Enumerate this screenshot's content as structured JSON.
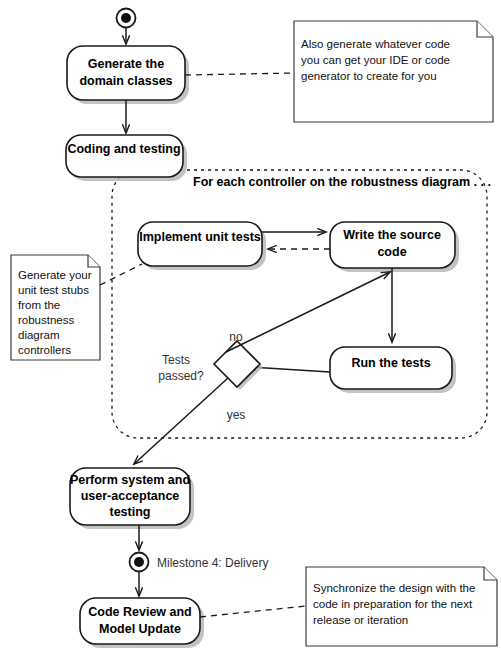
{
  "diagram": {
    "colors": {
      "stroke": "#1a1a1a",
      "fill": "#ffffff",
      "shadow": "#b9b9b9",
      "note_stroke": "#3a3a3a",
      "label_text": "#333333"
    },
    "start_node": {
      "name": "initial-node"
    },
    "activities": [
      {
        "id": "generate-domain-classes",
        "lines": [
          "Generate the",
          "domain classes"
        ]
      },
      {
        "id": "coding-and-testing",
        "lines": [
          "Coding and testing"
        ]
      },
      {
        "id": "implement-unit-tests",
        "lines": [
          "Implement unit tests"
        ]
      },
      {
        "id": "write-the-source-code",
        "lines": [
          "Write the source",
          "code"
        ]
      },
      {
        "id": "run-the-tests",
        "lines": [
          "Run the tests"
        ]
      },
      {
        "id": "perform-system-testing",
        "lines": [
          "Perform system and",
          "user-acceptance",
          "testing"
        ]
      },
      {
        "id": "code-review-model-update",
        "lines": [
          "Code Review and",
          "Model Update"
        ]
      }
    ],
    "region": {
      "label": "For each controller on the robustness diagram . . ."
    },
    "decision": {
      "id": "tests-passed-decision",
      "lines": [
        "Tests",
        "passed?"
      ],
      "guards": {
        "no": "no",
        "yes": "yes"
      }
    },
    "milestone": {
      "id": "milestone-4-node",
      "label": "Milestone 4: Delivery"
    },
    "notes": [
      {
        "id": "note-generate-code",
        "lines": [
          "Also generate whatever code",
          "you can get your IDE or code",
          "generator to create for you"
        ]
      },
      {
        "id": "note-unit-test-stubs",
        "lines": [
          "Generate your",
          "unit test stubs",
          "from the",
          "robustness",
          "diagram",
          "controllers"
        ]
      },
      {
        "id": "note-synchronize-design",
        "lines": [
          "Synchronize the design with the",
          "code in preparation for the next",
          "release or iteration"
        ]
      }
    ]
  }
}
